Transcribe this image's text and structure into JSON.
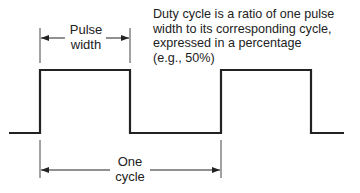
{
  "diagram": {
    "labels": {
      "pulse_width_line1": "Pulse",
      "pulse_width_line2": "width",
      "cycle_line1": "One",
      "cycle_line2": "cycle"
    },
    "description": [
      "Duty cycle is a ratio of one pulse",
      "width to its corresponding cycle,",
      "expressed in a percentage",
      "(e.g., 50%)"
    ],
    "colors": {
      "stroke": "#222222",
      "background": "#ffffff"
    }
  }
}
